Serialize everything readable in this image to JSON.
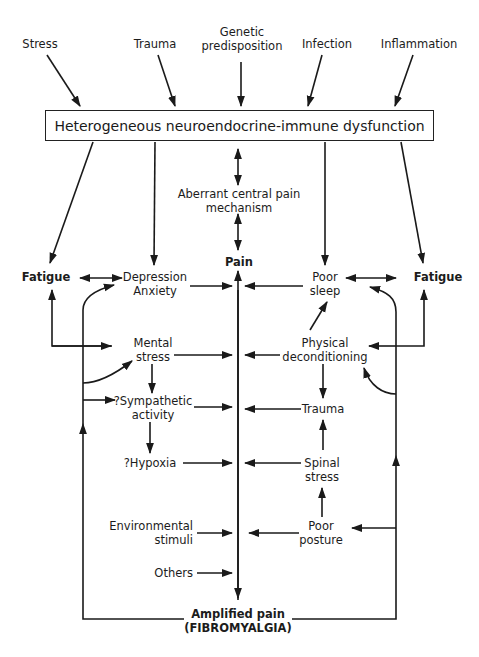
{
  "diagram": {
    "type": "flowchart",
    "triggers": [
      "Stress",
      "Trauma",
      "Genetic predisposition",
      "Infection",
      "Inflammation"
    ],
    "genetic_line1": "Genetic",
    "genetic_line2": "predisposition",
    "central_box": "Heterogeneous neuroendocrine-immune dysfunction",
    "aberrant": {
      "line1": "Aberrant central pain",
      "line2": "mechanism"
    },
    "pain": "Pain",
    "fatigue_left": "Fatigue",
    "fatigue_right": "Fatigue",
    "left_nodes": {
      "depression": {
        "line1": "Depression",
        "line2": "Anxiety"
      },
      "mental_stress": {
        "line1": "Mental",
        "line2": "stress"
      },
      "sympathetic": {
        "line1": "?Sympathetic",
        "line2": "activity"
      },
      "hypoxia": "?Hypoxia",
      "environmental": {
        "line1": "Environmental",
        "line2": "stimuli"
      },
      "others": "Others"
    },
    "right_nodes": {
      "poor_sleep": {
        "line1": "Poor",
        "line2": "sleep"
      },
      "physical": {
        "line1": "Physical",
        "line2": "deconditioning"
      },
      "trauma": "Trauma",
      "spinal_stress": {
        "line1": "Spinal",
        "line2": "stress"
      },
      "poor_posture": {
        "line1": "Poor",
        "line2": "posture"
      }
    },
    "outcome": {
      "line1": "Amplified pain",
      "line2": "(FIBROMYALGIA)"
    },
    "colors": {
      "line": "#1a1a1a",
      "background": "#ffffff"
    }
  }
}
